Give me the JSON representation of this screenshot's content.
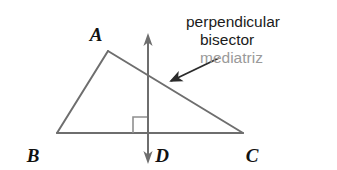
{
  "figure": {
    "kind": "geometry-diagram",
    "background_color": "#ffffff",
    "width": 337,
    "height": 170
  },
  "colors": {
    "stroke": "#6e6e6e",
    "stroke_dark": "#555555",
    "label_text": "#111111",
    "callout_en_text": "#1b1b1b",
    "callout_es_text": "#9a9a9a",
    "right_angle_mark": "#8a8a8a",
    "background": "#ffffff"
  },
  "triangle": {
    "name": "triangle-abc",
    "vertices": [
      {
        "label": "A",
        "x": 108,
        "y": 51,
        "label_x": 96,
        "label_y": 36
      },
      {
        "label": "B",
        "x": 57,
        "y": 133,
        "label_x": 28,
        "label_y": 157
      },
      {
        "label": "C",
        "x": 243,
        "y": 133,
        "label_x": 244,
        "label_y": 157
      }
    ],
    "sides": [
      {
        "name": "side-ab",
        "from": "A",
        "to": "B"
      },
      {
        "name": "side-ac",
        "from": "A",
        "to": "C"
      },
      {
        "name": "side-bc",
        "from": "B",
        "to": "C"
      }
    ]
  },
  "perpendicular_bisector": {
    "name": "perpendicular-bisector-line",
    "x": 148,
    "top_y": 35,
    "bottom_y": 162,
    "arrow_both_ends": true,
    "foot_point": {
      "label": "D",
      "x": 148,
      "y": 133,
      "label_x": 155,
      "label_y": 157
    }
  },
  "right_angle": {
    "name": "right-angle-mark",
    "x": 133,
    "y": 116,
    "size": 15,
    "quadrant": "lower-left"
  },
  "callout": {
    "name": "callout-label",
    "lines": [
      {
        "text": "perpendicular",
        "language": "en",
        "x": 186,
        "y": 26,
        "anchor": "start"
      },
      {
        "text": "bisector",
        "language": "en",
        "x": 200,
        "y": 44,
        "anchor": "start"
      },
      {
        "text": "mediatriz",
        "language": "es",
        "x": 200,
        "y": 62,
        "anchor": "start"
      }
    ],
    "pointer": {
      "name": "callout-pointer-arrow",
      "from_x": 219,
      "from_y": 58,
      "to_x": 169,
      "to_y": 82
    }
  }
}
